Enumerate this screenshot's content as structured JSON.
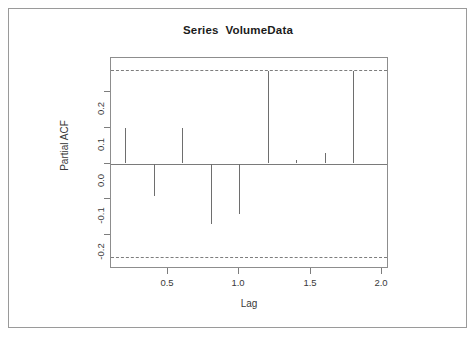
{
  "chart_data": {
    "type": "bar",
    "title": "Series  VolumeData",
    "xlabel": "Lag",
    "ylabel": "Partial ACF",
    "grid": false,
    "legend": null,
    "xlim": [
      0.1,
      2.05
    ],
    "ylim": [
      -0.295,
      0.295
    ],
    "x_ticks": [
      "0.5",
      "1.0",
      "1.5",
      "2.0"
    ],
    "x_tick_values": [
      0.5,
      1.0,
      1.5,
      2.0
    ],
    "y_ticks": [
      "0.2",
      "0.1",
      "0.0",
      "-0.1",
      "-0.2"
    ],
    "y_tick_values": [
      0.2,
      0.1,
      0.0,
      -0.1,
      -0.2
    ],
    "categories": [
      0.2,
      0.4,
      0.6,
      0.8,
      1.0,
      1.2,
      1.4,
      1.6,
      1.8,
      2.0
    ],
    "values": [
      0.1,
      -0.09,
      0.1,
      -0.17,
      -0.14,
      0.26,
      0.01,
      0.03,
      0.26,
      0.0
    ],
    "confidence_bounds": [
      0.262,
      -0.262
    ],
    "confidence_style": "dashed",
    "series": [
      {
        "name": "Partial ACF",
        "points": [
          {
            "lag": 0.2,
            "value": 0.1
          },
          {
            "lag": 0.4,
            "value": -0.09
          },
          {
            "lag": 0.6,
            "value": 0.1
          },
          {
            "lag": 0.8,
            "value": -0.17
          },
          {
            "lag": 1.0,
            "value": -0.14
          },
          {
            "lag": 1.2,
            "value": 0.26
          },
          {
            "lag": 1.4,
            "value": 0.01
          },
          {
            "lag": 1.6,
            "value": 0.03
          },
          {
            "lag": 1.8,
            "value": 0.26
          },
          {
            "lag": 2.0,
            "value": 0.0
          }
        ]
      }
    ]
  },
  "colors": {
    "spike": "#6e6e6e",
    "axis": "#7d7d7d",
    "frame": "#9a9a9a",
    "text": "#3a3a3a",
    "title": "#1b1b1b",
    "background": "#ffffff"
  }
}
